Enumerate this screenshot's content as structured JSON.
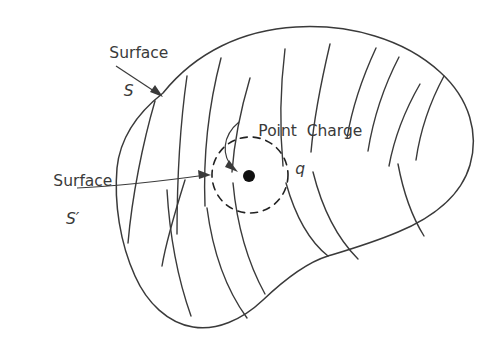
{
  "figure": {
    "background_color": "#ffffff",
    "stroke_color": "#3a3a3a",
    "charge_color": "#111111",
    "width": 501,
    "height": 345
  },
  "labels": {
    "surface_s": {
      "name": "Surface",
      "symbol": "S"
    },
    "surface_s_prime": {
      "name": "Surface",
      "symbol": "S′"
    },
    "point_charge": {
      "name": "Point  Charge",
      "symbol": "q"
    }
  },
  "elements": {
    "outer_surface_name": "irregular-closed-surface-S",
    "inner_surface_name": "dashed-spherical-surface-S-prime",
    "charge_name": "point-charge-dot",
    "field_lines_count": 10,
    "leader_s_name": "leader-line-surface-s",
    "leader_s_prime_name": "leader-line-surface-s-prime"
  }
}
